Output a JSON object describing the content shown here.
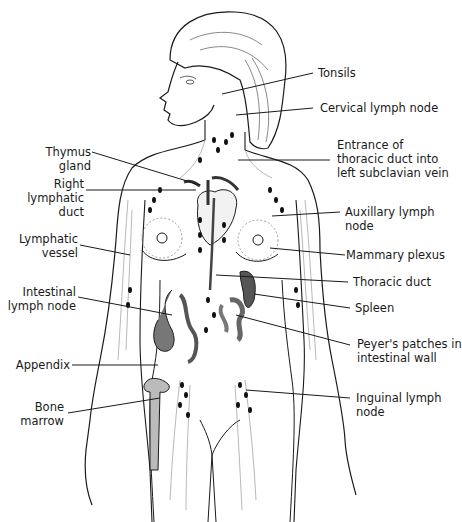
{
  "diagram": {
    "colors": {
      "line": "#1a1a1a",
      "vessel": "#8a8a8a",
      "node": "#111111",
      "organ": "#6e6e6e",
      "background": "#ffffff"
    },
    "labels_left": [
      {
        "id": "thymus",
        "text": "Thymus\ngland"
      },
      {
        "id": "right-lymphatic-duct",
        "text": "Right\nlymphatic\nduct"
      },
      {
        "id": "lymphatic-vessel",
        "text": "Lymphatic\nvessel"
      },
      {
        "id": "intestinal-lymph-node",
        "text": "Intestinal\nlymph node"
      },
      {
        "id": "appendix",
        "text": "Appendix"
      },
      {
        "id": "bone-marrow",
        "text": "Bone\nmarrow"
      }
    ],
    "labels_right": [
      {
        "id": "tonsils",
        "text": "Tonsils"
      },
      {
        "id": "cervical-lymph-node",
        "text": "Cervical lymph node"
      },
      {
        "id": "thoracic-duct-entrance",
        "text": "Entrance of\nthoracic duct into\nleft subclavian vein"
      },
      {
        "id": "auxillary-lymph-node",
        "text": "Auxillary lymph\nnode"
      },
      {
        "id": "mammary-plexus",
        "text": "Mammary plexus"
      },
      {
        "id": "thoracic-duct",
        "text": "Thoracic duct"
      },
      {
        "id": "spleen",
        "text": "Spleen"
      },
      {
        "id": "peyers-patches",
        "text": "Peyer's patches in\nintestinal wall"
      },
      {
        "id": "inguinal-lymph-node",
        "text": "Inguinal lymph\nnode"
      }
    ]
  }
}
